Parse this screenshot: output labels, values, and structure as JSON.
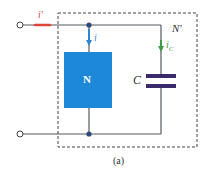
{
  "diagram": {
    "type": "circuit",
    "caption": "(a)",
    "subnetwork_label": "N'",
    "block_label": "N",
    "capacitor_label": "C",
    "currents": {
      "input": {
        "symbol": "i'",
        "color": "#e0453a"
      },
      "block": {
        "symbol": "i",
        "color": "#2f86cf"
      },
      "capacitor": {
        "symbol": "i",
        "subscript": "C",
        "color": "#3f9a4a"
      }
    },
    "colors": {
      "wire": "#555a60",
      "block_fill": "#1e88d8",
      "capacitor": "#3b2a6b",
      "node": "#2b4a7a",
      "dashed_box": "#444444"
    }
  }
}
